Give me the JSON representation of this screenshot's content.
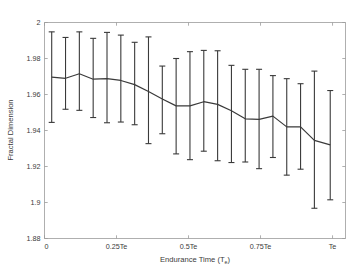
{
  "figure": {
    "background": "#ffffff",
    "line_color": "#3a3a3a",
    "axis_color": "#9a9a9a"
  },
  "axes": {
    "y_title": "Fractal Dimension",
    "x_title_main": "Endurance Time (T",
    "x_title_sub": "e",
    "x_title_close": ")"
  },
  "chart_data": {
    "type": "line",
    "title": "",
    "xlabel": "Endurance Time (Te)",
    "ylabel": "Fractal Dimension",
    "xlim": [
      0,
      1.045
    ],
    "ylim": [
      1.88,
      2.0
    ],
    "grid": false,
    "legend": null,
    "x_tick_values": [
      0,
      0.25,
      0.5,
      0.75,
      1.0
    ],
    "x_tick_labels": [
      "0",
      "0.25Te",
      "0.5Te",
      "0.75Te",
      "Te"
    ],
    "y_tick_values": [
      1.88,
      1.9,
      1.92,
      1.94,
      1.96,
      1.98,
      2
    ],
    "y_tick_labels": [
      "1.88",
      "1.9",
      "1.92",
      "1.94",
      "1.96",
      "1.98",
      "2"
    ],
    "x": [
      0.025,
      0.073,
      0.121,
      0.169,
      0.217,
      0.265,
      0.313,
      0.361,
      0.409,
      0.457,
      0.505,
      0.553,
      0.601,
      0.649,
      0.697,
      0.745,
      0.793,
      0.841,
      0.889,
      0.937,
      0.992
    ],
    "values": [
      1.9697,
      1.969,
      1.9715,
      1.9685,
      1.9688,
      1.9678,
      1.9655,
      1.9617,
      1.9575,
      1.9537,
      1.9537,
      1.956,
      1.9545,
      1.951,
      1.9465,
      1.9462,
      1.948,
      1.942,
      1.942,
      1.9345,
      1.932
    ],
    "err_upper": [
      1.9948,
      1.9917,
      1.9948,
      1.9912,
      1.9945,
      1.993,
      1.989,
      1.992,
      1.9758,
      1.98,
      1.9838,
      1.9845,
      1.9843,
      1.9762,
      1.974,
      1.974,
      1.9705,
      1.9688,
      1.966,
      1.973,
      1.9622
    ],
    "err_lower": [
      1.9445,
      1.9518,
      1.9512,
      1.9472,
      1.9443,
      1.9447,
      1.9432,
      1.9327,
      1.9382,
      1.927,
      1.9238,
      1.9285,
      1.9232,
      1.9222,
      1.9225,
      1.9188,
      1.925,
      1.9152,
      1.9185,
      1.8968,
      1.9015
    ],
    "series": [
      {
        "name": "Fractal Dimension",
        "values": [
          1.9697,
          1.969,
          1.9715,
          1.9685,
          1.9688,
          1.9678,
          1.9655,
          1.9617,
          1.9575,
          1.9537,
          1.9537,
          1.956,
          1.9545,
          1.951,
          1.9465,
          1.9462,
          1.948,
          1.942,
          1.942,
          1.9345,
          1.932
        ]
      }
    ]
  }
}
